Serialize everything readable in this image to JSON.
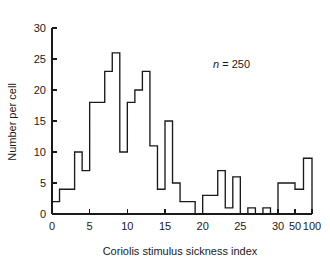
{
  "chart_data": {
    "type": "bar",
    "title": "",
    "subtitle": "",
    "xlabel": "Coriolis stimulus sickness index",
    "ylabel": "Number per cell",
    "xlim": [
      0,
      100
    ],
    "ylim": [
      0,
      30
    ],
    "grid": false,
    "legend": null,
    "legend_position": "none",
    "annotations": [
      {
        "name": "sample-size",
        "symbol": "n",
        "separator": "=",
        "value": "250",
        "text": "n = 250",
        "x": 21.5,
        "y": 22.5
      }
    ],
    "x_ticks": [
      {
        "label": "0",
        "value": 0
      },
      {
        "label": "5",
        "value": 5
      },
      {
        "label": "10",
        "value": 10
      },
      {
        "label": "15",
        "value": 15
      },
      {
        "label": "20",
        "value": 20
      },
      {
        "label": "25",
        "value": 25
      },
      {
        "label": "30",
        "value": 30
      },
      {
        "label": "50",
        "value": 50
      },
      {
        "label": "100",
        "value": 100
      }
    ],
    "y_ticks": [
      {
        "label": "0",
        "value": 0
      },
      {
        "label": "5",
        "value": 5
      },
      {
        "label": "10",
        "value": 10
      },
      {
        "label": "15",
        "value": 15
      },
      {
        "label": "20",
        "value": 20
      },
      {
        "label": "25",
        "value": 25
      },
      {
        "label": "30",
        "value": 30
      }
    ],
    "x_axis_note": "compressed scale beyond 30: 30-50 and 50-100 plotted as narrow segments",
    "categories": [
      "0-1",
      "1-2",
      "2-3",
      "3-4",
      "4-5",
      "5-6",
      "6-7",
      "7-8",
      "8-9",
      "9-10",
      "10-11",
      "11-12",
      "12-13",
      "13-14",
      "14-15",
      "15-16",
      "16-17",
      "17-18",
      "18-19",
      "19-20",
      "20-21",
      "21-22",
      "22-23",
      "23-24",
      "24-25",
      "25-26",
      "26-27",
      "27-28",
      "28-29",
      "29-30",
      "30-50",
      "50-75",
      "75-100"
    ],
    "bins": [
      {
        "start": 0,
        "end": 1,
        "value": 2
      },
      {
        "start": 1,
        "end": 2,
        "value": 4
      },
      {
        "start": 2,
        "end": 3,
        "value": 4
      },
      {
        "start": 3,
        "end": 4,
        "value": 10
      },
      {
        "start": 4,
        "end": 5,
        "value": 7
      },
      {
        "start": 5,
        "end": 6,
        "value": 18
      },
      {
        "start": 6,
        "end": 7,
        "value": 18
      },
      {
        "start": 7,
        "end": 8,
        "value": 23
      },
      {
        "start": 8,
        "end": 9,
        "value": 26
      },
      {
        "start": 9,
        "end": 10,
        "value": 10
      },
      {
        "start": 10,
        "end": 11,
        "value": 18
      },
      {
        "start": 11,
        "end": 12,
        "value": 20
      },
      {
        "start": 12,
        "end": 13,
        "value": 23
      },
      {
        "start": 13,
        "end": 14,
        "value": 11
      },
      {
        "start": 14,
        "end": 15,
        "value": 4
      },
      {
        "start": 15,
        "end": 16,
        "value": 15
      },
      {
        "start": 16,
        "end": 17,
        "value": 5
      },
      {
        "start": 17,
        "end": 18,
        "value": 2
      },
      {
        "start": 18,
        "end": 19,
        "value": 2
      },
      {
        "start": 19,
        "end": 20,
        "value": 0
      },
      {
        "start": 20,
        "end": 21,
        "value": 3
      },
      {
        "start": 21,
        "end": 22,
        "value": 3
      },
      {
        "start": 22,
        "end": 23,
        "value": 7
      },
      {
        "start": 23,
        "end": 24,
        "value": 1
      },
      {
        "start": 24,
        "end": 25,
        "value": 6
      },
      {
        "start": 25,
        "end": 26,
        "value": 0
      },
      {
        "start": 26,
        "end": 27,
        "value": 1
      },
      {
        "start": 27,
        "end": 28,
        "value": 0
      },
      {
        "start": 28,
        "end": 29,
        "value": 1
      },
      {
        "start": 29,
        "end": 30,
        "value": 0
      },
      {
        "start": 30,
        "end": 50,
        "value": 5
      },
      {
        "start": 50,
        "end": 75,
        "value": 4
      },
      {
        "start": 75,
        "end": 100,
        "value": 9
      }
    ],
    "values": [
      2,
      4,
      4,
      10,
      7,
      18,
      18,
      23,
      26,
      10,
      18,
      20,
      23,
      11,
      4,
      15,
      5,
      2,
      2,
      0,
      3,
      3,
      7,
      1,
      6,
      0,
      1,
      0,
      1,
      0,
      5,
      4,
      9
    ],
    "colors": {
      "line": "#1a1a1a",
      "axis": "#1a1a1a",
      "background": "#ffffff",
      "fill": "none"
    }
  }
}
